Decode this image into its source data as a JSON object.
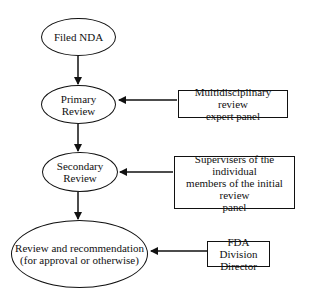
{
  "diagram": {
    "nodes": {
      "filed_nda": {
        "label": "Filed NDA"
      },
      "primary_review": {
        "line1": "Primary",
        "line2": "Review"
      },
      "secondary_review": {
        "line1": "Secondary",
        "line2": "Review"
      },
      "final_review": {
        "line1": "Review and recommendation",
        "line2": "(for approval or otherwise)"
      }
    },
    "inputs": {
      "expert_panel": {
        "line1": "Multidisciplinary review",
        "line2": "expert panel"
      },
      "supervisers": {
        "line1": "Supervisers of the individual",
        "line2": "members of the initial",
        "line3": "review",
        "line4": "panel"
      },
      "division_director": {
        "line1": "FDA Division",
        "line2": "Director"
      }
    },
    "edges": [
      {
        "from": "Filed NDA",
        "to": "Primary Review"
      },
      {
        "from": "Primary Review",
        "to": "Secondary Review"
      },
      {
        "from": "Secondary Review",
        "to": "Review and recommendation (for approval or otherwise)"
      },
      {
        "from": "Multidisciplinary review expert panel",
        "to": "Primary Review"
      },
      {
        "from": "Supervisers of the individual members of the initial review panel",
        "to": "Secondary Review"
      },
      {
        "from": "FDA Division Director",
        "to": "Review and recommendation (for approval or otherwise)"
      }
    ]
  }
}
